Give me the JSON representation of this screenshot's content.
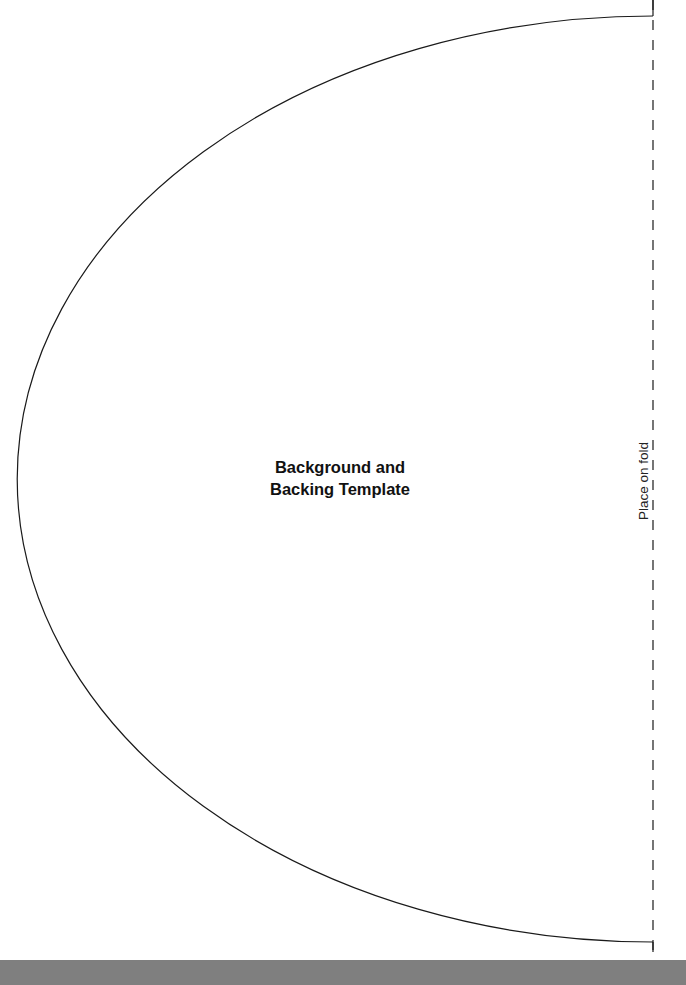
{
  "template": {
    "title_line1": "Background and",
    "title_line2": "Backing Template",
    "fold_label": "Place on fold"
  },
  "shape": {
    "type": "half-ellipse",
    "center_x": 653,
    "center_y": 479,
    "radius_x": 636,
    "radius_y": 463,
    "stroke_color": "#1a1a1a",
    "fold_line_style": "dashed"
  },
  "colors": {
    "page": "#ffffff",
    "bottom_band": "#7f7f7f",
    "line": "#1a1a1a"
  }
}
